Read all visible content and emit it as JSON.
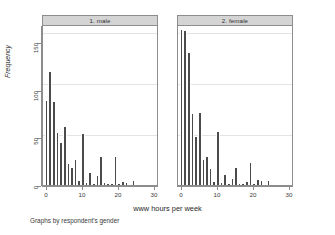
{
  "figure": {
    "xlabel": "www hours per week",
    "ylabel": "Frequency",
    "caption": "Graphs by respondent's gender",
    "bar_color": "#4b4b4b",
    "panel_header_color": "#d4d4d4",
    "frame_color": "#8d8d8d",
    "grid_color": "#e3e3e3"
  },
  "panels": [
    {
      "title": "1. male"
    },
    {
      "title": "2. female"
    }
  ],
  "axes": {
    "y_ticks": [
      "0",
      "50",
      "100",
      "150"
    ],
    "y_tick_values": [
      0,
      50,
      100,
      150
    ],
    "x_ticks": [
      "0",
      "10",
      "20",
      "30"
    ],
    "x_tick_values": [
      0,
      10,
      20,
      30
    ],
    "ylim": [
      0,
      168
    ],
    "xlim": [
      -1,
      31
    ]
  },
  "chart_data": {
    "type": "bar",
    "title": "",
    "subtitle": "",
    "xlabel": "www hours per week",
    "ylabel": "Frequency",
    "caption": "Graphs by respondent's gender",
    "grid": true,
    "legend": "none",
    "facet_by": "respondent's gender",
    "panel_titles": [
      "1. male",
      "2. female"
    ],
    "xlim": [
      -1,
      31
    ],
    "ylim": [
      0,
      168
    ],
    "x_ticks": [
      0,
      10,
      20,
      30
    ],
    "y_ticks": [
      0,
      50,
      100,
      150
    ],
    "bin_width": 1,
    "x": [
      0,
      1,
      2,
      3,
      4,
      5,
      6,
      7,
      8,
      9,
      10,
      11,
      12,
      13,
      14,
      15,
      16,
      17,
      18,
      19,
      20,
      21,
      22,
      23,
      24
    ],
    "series": [
      {
        "name": "1. male",
        "panel": 0,
        "values": [
          88,
          119,
          87,
          55,
          44,
          61,
          22,
          18,
          26,
          4,
          54,
          2,
          13,
          1,
          9,
          29,
          2,
          1,
          1,
          29,
          1,
          3,
          2,
          0,
          4
        ]
      },
      {
        "name": "2. female",
        "panel": 1,
        "values": [
          163,
          162,
          139,
          75,
          50,
          76,
          26,
          29,
          17,
          3,
          56,
          2,
          11,
          1,
          6,
          18,
          1,
          1,
          3,
          23,
          1,
          5,
          4,
          0,
          4
        ]
      }
    ]
  }
}
